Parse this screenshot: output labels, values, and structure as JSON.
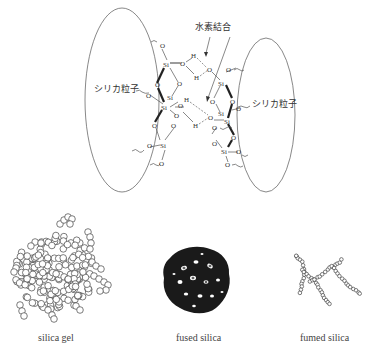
{
  "top_diagram": {
    "label_hydrogen_bond": "水素結合",
    "label_particle_left": "シリカ粒子",
    "label_particle_right": "シリカ粒子",
    "atoms": {
      "si": "Si",
      "o": "O",
      "h": "H"
    }
  },
  "bottom_diagram": {
    "items": [
      {
        "label": "silica gel"
      },
      {
        "label": "fused silica"
      },
      {
        "label": "fumed silica"
      }
    ]
  }
}
